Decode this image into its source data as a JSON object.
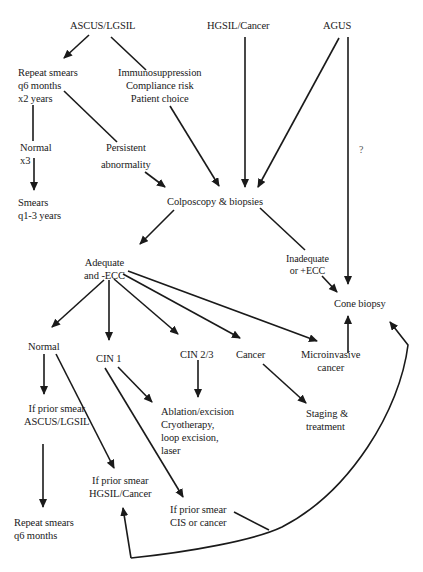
{
  "diagram": {
    "type": "flowchart",
    "title": "",
    "nodes": {
      "ascus_lgsil": {
        "lines": [
          "ASCUS/LGSIL"
        ]
      },
      "hgsil_cancer": {
        "lines": [
          "HGSIL/Cancer"
        ]
      },
      "agus": {
        "lines": [
          "AGUS"
        ]
      },
      "repeat_smears": {
        "lines": [
          "Repeat smears",
          "q6 months",
          "x2 years"
        ]
      },
      "risk_factors": {
        "lines": [
          "Immunosuppression",
          "Compliance risk",
          "Patient choice"
        ]
      },
      "normal_x3": {
        "lines": [
          "Normal",
          "x3"
        ]
      },
      "persistent": {
        "lines": [
          "Persistent",
          "abnormality"
        ]
      },
      "smears_q1_3": {
        "lines": [
          "Smears",
          "q1-3 years"
        ]
      },
      "colposcopy": {
        "lines": [
          "Colposcopy & biopsies"
        ]
      },
      "adequate": {
        "lines": [
          "Adequate",
          "and -ECC"
        ]
      },
      "inadequate": {
        "lines": [
          "Inadequate",
          "or +ECC"
        ]
      },
      "cone_biopsy": {
        "lines": [
          "Cone biopsy"
        ]
      },
      "normal": {
        "lines": [
          "Normal"
        ]
      },
      "cin1": {
        "lines": [
          "CIN 1"
        ]
      },
      "cin23": {
        "lines": [
          "CIN 2/3"
        ]
      },
      "cancer": {
        "lines": [
          "Cancer"
        ]
      },
      "microinvasive": {
        "lines": [
          "Microinvasive",
          "cancer"
        ]
      },
      "prior_ascus": {
        "lines": [
          "If prior smear",
          "ASCUS/LGSIL"
        ]
      },
      "ablation": {
        "lines": [
          "Ablation/excision",
          "Cryotherapy,",
          "loop excision,",
          "laser"
        ]
      },
      "staging": {
        "lines": [
          "Staging &",
          "treatment"
        ]
      },
      "prior_hgsil": {
        "lines": [
          "If prior smear",
          "HGSIL/Cancer"
        ]
      },
      "prior_cis": {
        "lines": [
          "If prior smear",
          "CIS or cancer"
        ]
      },
      "repeat_q6": {
        "lines": [
          "Repeat smears",
          "q6 months"
        ]
      }
    },
    "annotations": {
      "agus_cone_question": "?"
    },
    "edges": [
      {
        "from": "ascus_lgsil",
        "to": "repeat_smears",
        "arrow": true
      },
      {
        "from": "ascus_lgsil",
        "to": "risk_factors",
        "arrow": false
      },
      {
        "from": "repeat_smears",
        "to": "normal_x3",
        "arrow": false
      },
      {
        "from": "normal_x3",
        "to": "smears_q1_3",
        "arrow": true
      },
      {
        "from": "repeat_smears",
        "to": "persistent",
        "arrow": false
      },
      {
        "from": "persistent",
        "to": "colposcopy",
        "arrow": true
      },
      {
        "from": "risk_factors",
        "to": "colposcopy",
        "arrow": true
      },
      {
        "from": "hgsil_cancer",
        "to": "colposcopy",
        "arrow": true
      },
      {
        "from": "agus",
        "to": "colposcopy",
        "arrow": true
      },
      {
        "from": "agus",
        "to": "cone_biopsy",
        "arrow": true,
        "label": "?"
      },
      {
        "from": "colposcopy",
        "to": "adequate",
        "arrow": true
      },
      {
        "from": "colposcopy",
        "to": "inadequate",
        "arrow": false
      },
      {
        "from": "inadequate",
        "to": "cone_biopsy",
        "arrow": true
      },
      {
        "from": "adequate",
        "to": "normal",
        "arrow": true
      },
      {
        "from": "adequate",
        "to": "cin1",
        "arrow": true
      },
      {
        "from": "adequate",
        "to": "cin23",
        "arrow": true
      },
      {
        "from": "adequate",
        "to": "cancer",
        "arrow": true
      },
      {
        "from": "adequate",
        "to": "microinvasive",
        "arrow": true
      },
      {
        "from": "microinvasive",
        "to": "cone_biopsy",
        "arrow": true
      },
      {
        "from": "normal",
        "to": "prior_ascus",
        "arrow": true
      },
      {
        "from": "normal",
        "to": "prior_hgsil",
        "arrow": true
      },
      {
        "from": "prior_ascus",
        "to": "repeat_q6",
        "arrow": true
      },
      {
        "from": "cin1",
        "to": "ablation",
        "arrow": true
      },
      {
        "from": "cin1",
        "to": "prior_cis",
        "arrow": true
      },
      {
        "from": "cin23",
        "to": "ablation",
        "arrow": true
      },
      {
        "from": "cancer",
        "to": "staging",
        "arrow": true
      },
      {
        "from": "prior_cis",
        "to": "prior_hgsil",
        "arrow": true,
        "curved": true
      },
      {
        "from": "prior_cis",
        "to": "cone_biopsy",
        "arrow": true,
        "curved": true
      }
    ]
  }
}
